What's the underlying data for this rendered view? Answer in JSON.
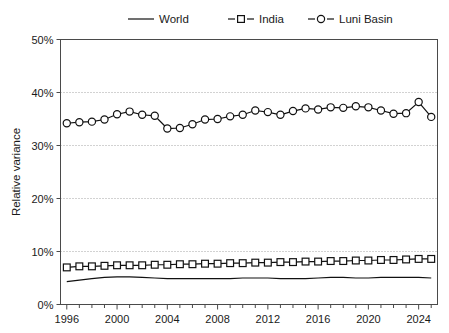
{
  "chart_data": {
    "type": "line",
    "title": "",
    "xlabel": "",
    "ylabel": "Relative variance",
    "xlim": [
      1995.5,
      2025.5
    ],
    "ylim": [
      0,
      50
    ],
    "yunit": "%",
    "ytick_labels": [
      "0%",
      "10%",
      "20%",
      "30%",
      "40%",
      "50%"
    ],
    "ytick_values": [
      0,
      10,
      20,
      30,
      40,
      50
    ],
    "xtick_labels": [
      "1996",
      "2000",
      "2004",
      "2008",
      "2012",
      "2016",
      "2020",
      "2024"
    ],
    "xtick_values": [
      1996,
      2000,
      2004,
      2008,
      2012,
      2016,
      2020,
      2024
    ],
    "minor_xticks_every": 1,
    "grid": "horizontal-dotted",
    "legend_position": "top",
    "x": [
      1996,
      1997,
      1998,
      1999,
      2000,
      2001,
      2002,
      2003,
      2004,
      2005,
      2006,
      2007,
      2008,
      2009,
      2010,
      2011,
      2012,
      2013,
      2014,
      2015,
      2016,
      2017,
      2018,
      2019,
      2020,
      2021,
      2022,
      2023,
      2024,
      2025
    ],
    "series": [
      {
        "name": "World",
        "marker": "none",
        "values": [
          4.3,
          4.6,
          4.9,
          5.1,
          5.2,
          5.2,
          5.1,
          5.0,
          4.9,
          4.9,
          4.9,
          4.9,
          4.9,
          4.9,
          5.0,
          5.0,
          5.0,
          4.9,
          4.9,
          4.9,
          5.0,
          5.1,
          5.1,
          5.0,
          5.0,
          5.1,
          5.1,
          5.1,
          5.1,
          5.0
        ]
      },
      {
        "name": "India",
        "marker": "square",
        "values": [
          7.0,
          7.2,
          7.2,
          7.3,
          7.4,
          7.4,
          7.4,
          7.5,
          7.5,
          7.6,
          7.6,
          7.7,
          7.7,
          7.8,
          7.8,
          7.9,
          7.9,
          8.0,
          8.0,
          8.1,
          8.1,
          8.2,
          8.2,
          8.3,
          8.3,
          8.4,
          8.4,
          8.5,
          8.6,
          8.6
        ]
      },
      {
        "name": "Luni Basin",
        "marker": "circle",
        "values": [
          34.2,
          34.4,
          34.5,
          34.9,
          35.9,
          36.4,
          35.8,
          35.6,
          33.2,
          33.3,
          34.0,
          34.9,
          35.0,
          35.5,
          35.8,
          36.6,
          36.3,
          35.8,
          36.5,
          37.0,
          36.8,
          37.2,
          37.1,
          37.4,
          37.2,
          36.6,
          36.0,
          36.1,
          38.2,
          35.4
        ]
      }
    ]
  },
  "legend": {
    "items": [
      {
        "label": "World",
        "marker": "none"
      },
      {
        "label": "India",
        "marker": "square"
      },
      {
        "label": "Luni Basin",
        "marker": "circle"
      }
    ]
  }
}
